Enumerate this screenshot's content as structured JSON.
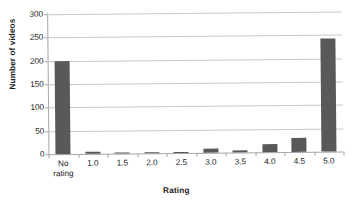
{
  "chart_data": {
    "type": "bar",
    "title": "",
    "xlabel": "Rating",
    "ylabel": "Number of videos",
    "categories": [
      "No\nrating",
      "1.0",
      "1.5",
      "2.0",
      "2.5",
      "3.0",
      "3.5",
      "4.0",
      "4.5",
      "5.0"
    ],
    "values": [
      199,
      5,
      1,
      1,
      1,
      9,
      4,
      18,
      31,
      243
    ],
    "ylim": [
      0,
      300
    ],
    "yticks": [
      0,
      50,
      100,
      150,
      200,
      250,
      300
    ],
    "ytick_labels": [
      "0",
      "50",
      "100",
      "150",
      "200",
      "250",
      "300"
    ],
    "grid": true,
    "legend": false,
    "bar_color": "#595959",
    "gridline_color": "#c8c8c8",
    "axis_color": "#a6a6a6",
    "text_color": "#1c1c1c",
    "background": "#ffffff"
  }
}
